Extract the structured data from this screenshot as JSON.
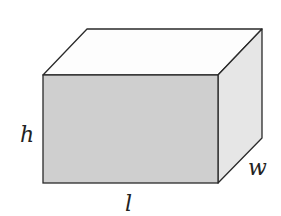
{
  "diagram": {
    "shape": "rectangular-prism",
    "labels": {
      "height": "h",
      "length": "l",
      "width": "w"
    },
    "colors": {
      "front_face": "#cfcfcf",
      "top_face": "#fdfdfd",
      "side_face": "#e6e6e6",
      "edge": "#2a2a2a",
      "label": "#222222"
    }
  }
}
